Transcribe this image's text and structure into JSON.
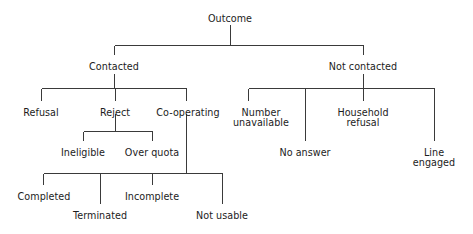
{
  "diagram": {
    "type": "tree",
    "title": "Outcome",
    "orientation": "top-down",
    "line_color": "#3a3a3a",
    "text_color": "#1c1c1c",
    "background_color": "#ffffff",
    "nodes": {
      "root": {
        "label": "Outcome",
        "x": 230,
        "y": 14
      },
      "contacted": {
        "label": "Contacted",
        "x": 114,
        "y": 62
      },
      "not_contacted": {
        "label": "Not contacted",
        "x": 363,
        "y": 62
      },
      "refusal": {
        "label": "Refusal",
        "x": 41,
        "y": 108
      },
      "reject": {
        "label": "Reject",
        "x": 115,
        "y": 108
      },
      "cooperating": {
        "label": "Co-operating",
        "x": 188,
        "y": 108
      },
      "number_unavailable": {
        "label_line1": "Number",
        "label_line2": "unavailable",
        "x": 261,
        "y": 108
      },
      "no_answer": {
        "label": "No answer",
        "x": 305,
        "y": 148
      },
      "household_refusal": {
        "label_line1": "Household",
        "label_line2": "refusal",
        "x": 363,
        "y": 108
      },
      "line_engaged": {
        "label_line1": "Line",
        "label_line2": "engaged",
        "x": 434,
        "y": 148
      },
      "ineligible": {
        "label": "Ineligible",
        "x": 83,
        "y": 148
      },
      "over_quota": {
        "label": "Over quota",
        "x": 152,
        "y": 148
      },
      "completed": {
        "label": "Completed",
        "x": 44,
        "y": 192
      },
      "terminated": {
        "label": "Terminated",
        "x": 100,
        "y": 211
      },
      "incomplete": {
        "label": "Incomplete",
        "x": 152,
        "y": 192
      },
      "not_usable": {
        "label": "Not usable",
        "x": 222,
        "y": 211
      }
    },
    "edges": [
      {
        "from": "root",
        "to": "contacted"
      },
      {
        "from": "root",
        "to": "not_contacted"
      },
      {
        "from": "contacted",
        "to": "refusal"
      },
      {
        "from": "contacted",
        "to": "reject"
      },
      {
        "from": "contacted",
        "to": "cooperating"
      },
      {
        "from": "not_contacted",
        "to": "number_unavailable"
      },
      {
        "from": "not_contacted",
        "to": "no_answer"
      },
      {
        "from": "not_contacted",
        "to": "household_refusal"
      },
      {
        "from": "not_contacted",
        "to": "line_engaged"
      },
      {
        "from": "reject",
        "to": "ineligible"
      },
      {
        "from": "reject",
        "to": "over_quota"
      },
      {
        "from": "cooperating",
        "to": "completed"
      },
      {
        "from": "cooperating",
        "to": "terminated"
      },
      {
        "from": "cooperating",
        "to": "incomplete"
      },
      {
        "from": "cooperating",
        "to": "not_usable"
      }
    ]
  }
}
